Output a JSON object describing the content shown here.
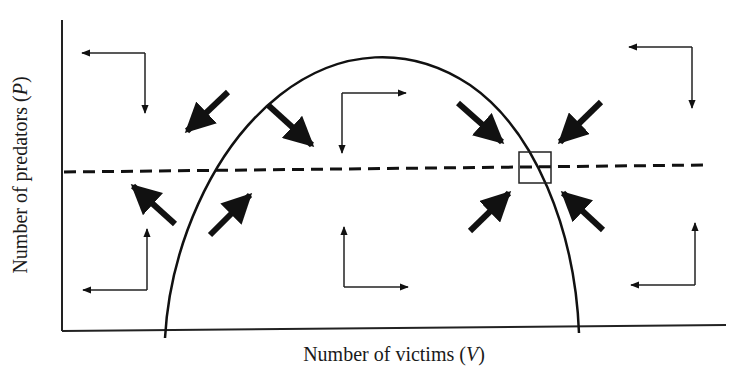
{
  "diagram": {
    "type": "phase-plane",
    "x_axis": {
      "label_prefix": "Number of victims (",
      "label_var": "V",
      "label_suffix": ")"
    },
    "y_axis": {
      "label_prefix": "Number of predators (",
      "label_var": "P",
      "label_suffix": ")"
    },
    "elements": {
      "victim_isocline": "hump-shaped curve (solid)",
      "predator_isocline": "horizontal dashed line",
      "equilibrium_marker": "square box at intersection of isoclines (right side)"
    },
    "colors": {
      "line": "#111111",
      "background": "#ffffff"
    }
  }
}
